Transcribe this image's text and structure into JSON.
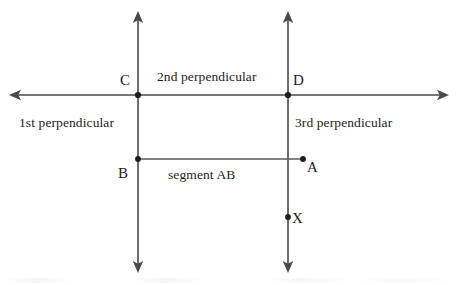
{
  "diagram": {
    "background_color": "#ffffff",
    "line_color": "#4a4a4a",
    "text_color": "#1d1d1d",
    "width": 456,
    "height": 285,
    "labels": {
      "first_perpendicular": "1st perpendicular",
      "second_perpendicular": "2nd perpendicular",
      "third_perpendicular": "3rd perpendicular",
      "segment_ab": "segment AB"
    },
    "points": [
      {
        "name": "C",
        "label": "C",
        "x": 138,
        "y": 95
      },
      {
        "name": "D",
        "label": "D",
        "x": 288,
        "y": 95
      },
      {
        "name": "B",
        "label": "B",
        "x": 138,
        "y": 159
      },
      {
        "name": "A",
        "label": "A",
        "x": 303,
        "y": 159
      },
      {
        "name": "X",
        "label": "X",
        "x": 288,
        "y": 217
      }
    ],
    "lines": [
      {
        "name": "first-perpendicular-line",
        "orientation": "vertical",
        "x": 138,
        "y1": 12,
        "y2": 272,
        "arrows": "both"
      },
      {
        "name": "third-perpendicular-line",
        "orientation": "vertical",
        "x": 288,
        "y1": 12,
        "y2": 272,
        "arrows": "both"
      },
      {
        "name": "second-perpendicular-line",
        "orientation": "horizontal",
        "y": 95,
        "x1": 10,
        "x2": 448,
        "arrows": "both"
      },
      {
        "name": "segment-ab-line",
        "orientation": "horizontal",
        "y": 159,
        "x1": 138,
        "x2": 303,
        "arrows": "none"
      }
    ]
  }
}
